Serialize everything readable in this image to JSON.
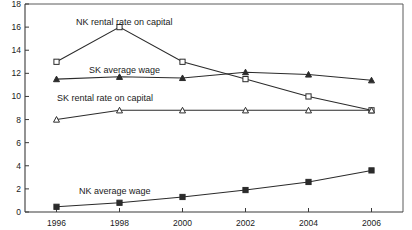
{
  "chart_data": {
    "type": "line",
    "title": "",
    "xlabel": "",
    "ylabel": "",
    "x": [
      1996,
      1998,
      2000,
      2002,
      2004,
      2006
    ],
    "xtick_labels": [
      "1996",
      "1998",
      "2000",
      "2002",
      "2004",
      "2006"
    ],
    "ytick_labels": [
      "0",
      "2",
      "4",
      "6",
      "8",
      "10",
      "12",
      "14",
      "16",
      "18"
    ],
    "ytick_values": [
      0,
      2,
      4,
      6,
      8,
      10,
      12,
      14,
      16,
      18
    ],
    "ylim": [
      0,
      18
    ],
    "xlim": [
      1995,
      2007
    ],
    "grid": false,
    "legend": "inline-annotations",
    "series": [
      {
        "name": "NK rental rate on capital",
        "marker": "open-square",
        "values": [
          13.0,
          16.0,
          13.0,
          11.5,
          10.0,
          8.8
        ]
      },
      {
        "name": "SK average wage",
        "marker": "solid-triangle",
        "values": [
          11.5,
          11.7,
          11.6,
          12.1,
          11.9,
          11.4
        ]
      },
      {
        "name": "SK rental rate on capital",
        "marker": "open-triangle",
        "values": [
          8.0,
          8.8,
          8.8,
          8.8,
          8.8,
          8.8
        ]
      },
      {
        "name": "NK average wage",
        "marker": "solid-square",
        "values": [
          0.45,
          0.8,
          1.3,
          1.9,
          2.6,
          3.6
        ]
      }
    ],
    "annotations": [
      {
        "text": "NK rental rate on capital",
        "x_px": 76,
        "y_px": 25
      },
      {
        "text": "SK average wage",
        "x_px": 89,
        "y_px": 73
      },
      {
        "text": "SK rental rate on capital",
        "x_px": 57,
        "y_px": 101
      },
      {
        "text": "NK average wage",
        "x_px": 79,
        "y_px": 194
      }
    ],
    "colors": {
      "line": "#2b2b2b",
      "axis": "#3a3a3a",
      "frame": "#5a5a5a",
      "background": "#ffffff"
    }
  }
}
